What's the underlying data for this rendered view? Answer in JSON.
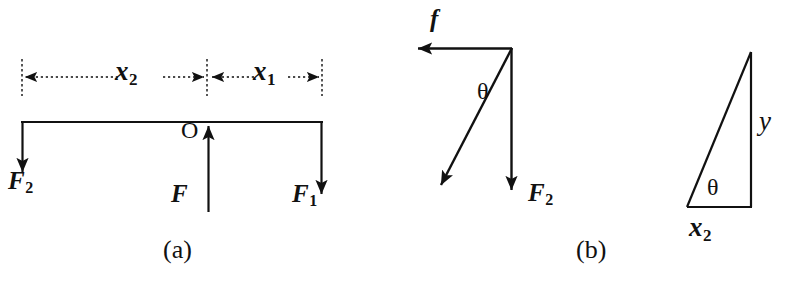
{
  "figure": {
    "background_color": "#ffffff",
    "ink_color": "#111111",
    "width": 788,
    "height": 290
  },
  "panel_a": {
    "caption": "(a)",
    "pivot_label": "O",
    "force_left": {
      "symbol": "F",
      "subscript": "2",
      "direction": "down"
    },
    "force_right": {
      "symbol": "F",
      "subscript": "1",
      "direction": "down"
    },
    "force_center": {
      "symbol": "F",
      "subscript": "",
      "direction": "up"
    },
    "dimension_left": {
      "symbol": "x",
      "subscript": "2"
    },
    "dimension_right": {
      "symbol": "x",
      "subscript": "1"
    }
  },
  "panel_b": {
    "caption": "(b)",
    "friction_force": {
      "symbol": "f",
      "subscript": "",
      "direction": "left"
    },
    "weight_force": {
      "symbol": "F",
      "subscript": "2",
      "direction": "down"
    },
    "angle_label": "θ",
    "resultant": {
      "direction": "down-left"
    }
  },
  "panel_c": {
    "base_label": {
      "symbol": "x",
      "subscript": "2"
    },
    "height_label": {
      "symbol": "y",
      "subscript": ""
    },
    "angle_label": "θ"
  }
}
